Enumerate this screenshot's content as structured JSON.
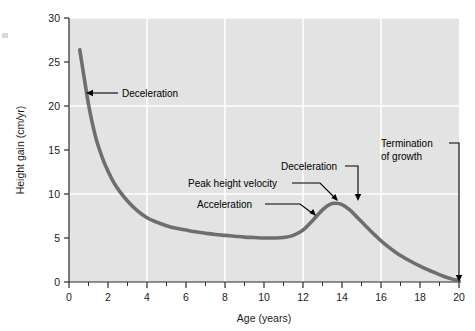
{
  "chart_data": {
    "type": "line",
    "title": "",
    "xlabel": "Age (years)",
    "ylabel": "Height gain (cm/yr)",
    "xlim": [
      0,
      20
    ],
    "ylim": [
      0,
      30
    ],
    "xticks": [
      0,
      2,
      4,
      6,
      8,
      10,
      12,
      14,
      16,
      18,
      20
    ],
    "xtick_labels": [
      "0",
      "2",
      "4",
      "6",
      "8",
      "10",
      "12",
      "14",
      "16",
      "18",
      "20"
    ],
    "xminor_ticks": [
      1,
      3,
      5,
      7,
      9,
      11,
      13,
      15,
      17,
      19
    ],
    "yticks": [
      0,
      5,
      10,
      15,
      20,
      25,
      30
    ],
    "ytick_labels": [
      "0",
      "5",
      "10",
      "15",
      "20",
      "25",
      "30"
    ],
    "grid": {
      "vertical_at_x": [
        4,
        8,
        12,
        16
      ],
      "horizontal_at_y": [
        10,
        20,
        30
      ],
      "color": "#ffffff"
    },
    "plot_background": "#e3e3e3",
    "line_color": "#6e6e6e",
    "line_width": 3.6,
    "series": [
      {
        "name": "Height velocity",
        "x": [
          0.55,
          0.7,
          0.85,
          1.0,
          1.2,
          1.4,
          1.6,
          1.8,
          2.0,
          2.3,
          2.6,
          3.0,
          3.5,
          4.0,
          4.5,
          5.0,
          5.5,
          6.0,
          6.5,
          7.0,
          7.5,
          8.0,
          8.5,
          9.0,
          9.5,
          10.0,
          10.5,
          11.0,
          11.5,
          12.0,
          12.5,
          13.0,
          13.4,
          13.7,
          14.0,
          14.4,
          14.8,
          15.2,
          15.7,
          16.2,
          16.8,
          17.4,
          18.0,
          18.6,
          19.2,
          19.7,
          20.0
        ],
        "y": [
          26.4,
          24.3,
          22.2,
          20.2,
          18.0,
          16.2,
          14.8,
          13.6,
          12.6,
          11.3,
          10.3,
          9.2,
          8.1,
          7.3,
          6.8,
          6.4,
          6.1,
          5.9,
          5.7,
          5.55,
          5.4,
          5.3,
          5.2,
          5.1,
          5.05,
          5.0,
          5.0,
          5.05,
          5.3,
          5.9,
          7.0,
          8.2,
          8.85,
          8.95,
          8.8,
          8.2,
          7.3,
          6.4,
          5.3,
          4.3,
          3.3,
          2.5,
          1.8,
          1.2,
          0.65,
          0.3,
          0.15
        ]
      }
    ],
    "annotations": [
      {
        "id": "deceleration-early",
        "text": "Deceleration",
        "text_x": 122,
        "text_y": 97,
        "leader": "M 118 93 L 90 93",
        "arrow_at": [
          86,
          93
        ],
        "arrow_direction": "left"
      },
      {
        "id": "peak-height-velocity",
        "text": "Peak height velocity",
        "text_x": 188,
        "text_y": 187,
        "leader": "M 292 183 L 320 183 L 334 197",
        "arrow_at": [
          338,
          201
        ],
        "arrow_direction": "down-right"
      },
      {
        "id": "acceleration",
        "text": "Acceleration",
        "text_x": 197,
        "text_y": 208,
        "leader": "M 265 204 L 300 204 L 312 213",
        "arrow_at": [
          316,
          216
        ],
        "arrow_direction": "down-right"
      },
      {
        "id": "deceleration-late",
        "text": "Deceleration",
        "text_x": 281,
        "text_y": 170,
        "leader": "M 345 166 L 358 166 L 358 196",
        "arrow_at": [
          358,
          201
        ],
        "arrow_direction": "down"
      },
      {
        "id": "termination-of-growth",
        "text_line1": "Termination",
        "text_line2": "of growth",
        "text_x": 381,
        "text_y": 147,
        "leader": "M 449 143 L 459 143 L 459 276",
        "arrow_at": [
          459,
          282
        ],
        "arrow_direction": "down"
      }
    ]
  }
}
